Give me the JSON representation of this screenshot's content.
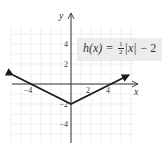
{
  "chart_data": {
    "type": "line",
    "title": "",
    "function_label": {
      "lhs": "h(x)",
      "equals": "=",
      "frac_num": "1",
      "frac_den": "2",
      "abs": "|x|",
      "rest": "− 2",
      "full": "h(x) = 1/2|x| − 2"
    },
    "xlabel": "x",
    "ylabel": "y",
    "xlim": [
      -6,
      6
    ],
    "ylim": [
      -6,
      6
    ],
    "grid": true,
    "x_ticks": [
      {
        "value": -4,
        "label": "−4"
      },
      {
        "value": 2,
        "label": "2"
      },
      {
        "value": 4,
        "label": "4"
      }
    ],
    "y_ticks": [
      {
        "value": 4,
        "label": "4"
      },
      {
        "value": 2,
        "label": "2"
      },
      {
        "value": -2,
        "label": "−2"
      },
      {
        "value": -4,
        "label": "−4"
      }
    ],
    "series": [
      {
        "name": "h(x) = 1/2|x| − 2",
        "x": [
          -5.8,
          0,
          5.8
        ],
        "y": [
          0.9,
          -2,
          0.9
        ],
        "arrows_both_ends": true,
        "color": "#1a1a1a"
      }
    ]
  },
  "colors": {
    "label_box": "#ececec",
    "grid": "#c9c9c9",
    "axis": "#333333"
  }
}
